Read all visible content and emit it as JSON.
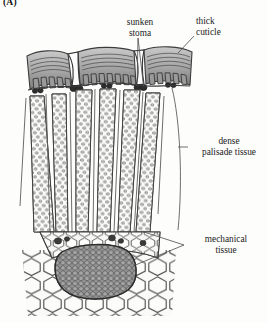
{
  "figure": {
    "panel_a_label": "(A)",
    "panel_b_label": "(B)",
    "background_color": "#fdfdfc",
    "ink_color": "#1a1a1a"
  },
  "callouts": {
    "sunken_stoma": {
      "line1": "sunken",
      "line2": "stoma"
    },
    "thick_cuticle": {
      "line1": "thick",
      "line2": "cuticle"
    },
    "dense_palisade": {
      "line1": "dense",
      "line2": "palisade  tissue"
    },
    "mechanical_tissue": {
      "line1": "mechanical",
      "line2": "tissue"
    }
  },
  "colors": {
    "epidermis_fill": "#a9a9a9",
    "epidermis_dark": "#6f6f6f",
    "epidermis_light": "#cfcfcf",
    "palisade_outline": "#4a4a4a",
    "palisade_cell": "#d8d8d8",
    "sclerenchyma_dark": "#5c5c5c",
    "parenchyma_fill": "#f2f2f0",
    "leader_line": "#5a5a5a"
  }
}
